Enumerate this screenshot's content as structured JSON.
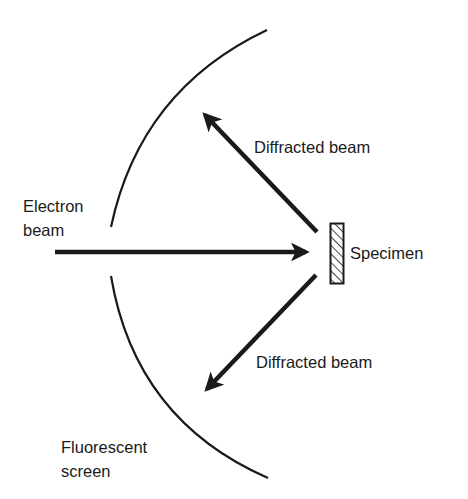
{
  "diagram": {
    "labels": {
      "electron_beam_line1": "Electron",
      "electron_beam_line2": "beam",
      "diffracted_beam_upper": "Diffracted beam",
      "diffracted_beam_lower": "Diffracted beam",
      "specimen": "Specimen",
      "screen_line1": "Fluorescent",
      "screen_line2": "screen"
    },
    "elements": {
      "incident_beam": {
        "from": [
          55,
          252
        ],
        "to": [
          308,
          252
        ]
      },
      "upper_diffracted_beam": {
        "from": [
          317,
          232
        ],
        "to": [
          202,
          112
        ]
      },
      "lower_diffracted_beam": {
        "from": [
          316,
          275
        ],
        "to": [
          204,
          392
        ]
      },
      "specimen": {
        "x": 330,
        "y": 223,
        "width": 14,
        "height": 61,
        "pattern": "hatched"
      },
      "screen_upper_arc": {
        "from": [
          267,
          30
        ],
        "to": [
          111,
          227
        ]
      },
      "screen_lower_arc": {
        "from": [
          111,
          276
        ],
        "to": [
          268,
          478
        ]
      }
    },
    "colors": {
      "ink": "#1a1a1a",
      "background": "#ffffff"
    }
  }
}
